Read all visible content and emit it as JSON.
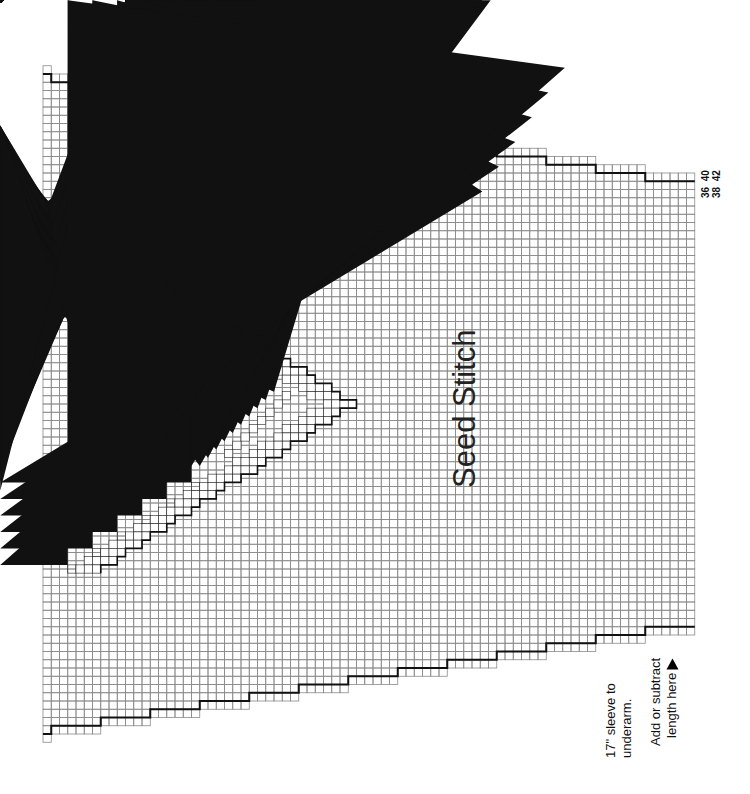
{
  "chart": {
    "title": "Seed Stitch",
    "sizes_top": [
      "40",
      "42"
    ],
    "sizes_bottom": [
      "36",
      "38"
    ],
    "note_sleeve": [
      "17\" sleeve to",
      "underarm."
    ],
    "note_adjust": [
      "Add or subtract",
      "length here"
    ],
    "arrow_icon": "triangle-up-icon"
  },
  "grid": {
    "origin_x": 43,
    "cell": 8.25,
    "center_y": 404,
    "cols": 79,
    "base_half_rows": 40,
    "step_cols": 6,
    "line_color": "#8a8a8a",
    "outline_color": "#111111"
  },
  "motif": {
    "tip_col": 37,
    "half_height_rows": 20,
    "symbols": [
      "slash",
      "dot",
      "oval",
      "triangle",
      "solid"
    ]
  }
}
